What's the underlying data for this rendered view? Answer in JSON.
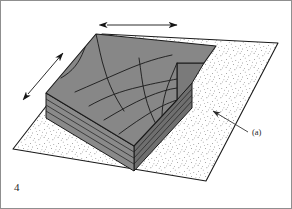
{
  "figure": {
    "number": "4",
    "caption_label": "(a)",
    "domain_note": "geological block diagram"
  },
  "colors": {
    "frame_border": "#8f8f8f",
    "page_background": "#ffffff",
    "block_top_face": "#878787",
    "block_front_face": "#8a8a8a",
    "block_side_face": "#6f6f6f",
    "block_notch_face": "#7a7a7a",
    "outline": "#1a1a1a",
    "fold_trace": "#1f1f1f",
    "stipple_dot": "#3a3a3a",
    "plane_fill": "#ffffff",
    "arrow": "#151515",
    "leader_line": "#2b2b2b",
    "text": "#262626"
  },
  "annotations": {
    "arrows": [
      {
        "name": "extension-arrow-top",
        "orientation": "horizontal",
        "heads": "double",
        "x1": 106,
        "y1": 24,
        "x2": 176,
        "y2": 24
      },
      {
        "name": "extension-arrow-left",
        "orientation": "diagonal",
        "heads": "double",
        "x1": 27,
        "y1": 93,
        "x2": 62,
        "y2": 52
      }
    ],
    "leader": {
      "name": "leader-to-ground-plane",
      "x1": 247,
      "y1": 131,
      "x2": 212,
      "y2": 110,
      "label": "(a)",
      "label_x": 251,
      "label_y": 134
    }
  },
  "geometry": {
    "ground_plane": {
      "name": "stippled-ground-plane",
      "points": "12,148 101,33 277,42 205,180"
    },
    "block": {
      "top_face": "95,33 45,92 133,145 176,99 176,62 203,62 215,45",
      "front_face": "45,92 45,117 133,170 133,145",
      "side_face": "133,145 133,170 191,107 191,82",
      "notch_inner": "176,62 176,99 191,82 203,62"
    }
  },
  "strata_lines": {
    "front_face": [
      "45,98 133,151",
      "45,104 133,157",
      "45,110 133,163"
    ],
    "side_face": [
      "133,151 191,88",
      "133,157 191,94",
      "133,163 191,100"
    ]
  },
  "fold_traces": [
    "M 60,77 C 72,70 78,62 83,49 C 86,41 90,37 95,33",
    "M 74,91 C 90,84 104,78 120,71 C 136,64 152,58 171,54",
    "M 88,105 C 104,96 120,90 138,86 C 154,82 166,80 176,78",
    "M 103,119 C 118,110 132,102 146,96 C 158,91 168,88 176,87",
    "M 118,133 C 130,124 142,116 152,110 C 162,104 170,101 176,99",
    "M 95,33 C 98,46 100,58 104,70 C 108,84 114,96 123,110",
    "M 138,57 C 140,70 141,82 144,94 C 147,106 151,116 157,127",
    "M 176,62 C 172,72 168,80 165,90 C 162,100 161,108 161,116",
    "M 203,62 C 198,70 193,76 191,82"
  ],
  "text_items": {
    "figure_number": "4",
    "part_label": "(a)"
  }
}
